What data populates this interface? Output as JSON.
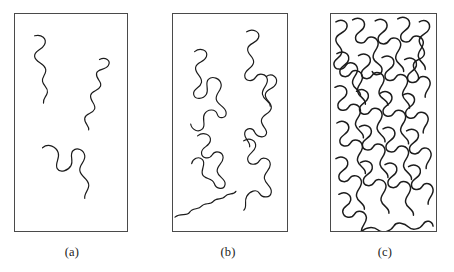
{
  "figure": {
    "type": "schematic-diagram",
    "background_color": "#ffffff",
    "panel_border_color": "#4a4a4a",
    "chain_color": "#1c1c1c"
  },
  "panels": [
    {
      "id": "a",
      "caption": "(a)",
      "regime": "dilute",
      "chain_count": 3,
      "stroke_width": 1.2,
      "box": {
        "x": 14,
        "y": 13,
        "width": 114,
        "height": 219
      },
      "chains": [
        "M 20 22 C 27 20 33 25 30 31 C 27 37 19 37 20 43 C 21 49 29 49 31 55 C 33 60 27 63 28 68 C 29 73 34 74 33 79 C 32 84 28 85 29 90",
        "M 86 46 C 92 43 98 47 95 52 C 92 57 84 55 83 60 C 82 66 89 68 87 73 C 85 78 78 77 77 82 C 76 88 83 91 81 96 C 79 101 72 100 71 105 C 70 110 76 113 75 117",
        "M 28 135 C 34 130 42 134 44 140 C 46 146 40 151 43 156 C 46 161 54 158 57 153 C 60 148 55 142 59 138 C 63 134 70 137 71 143 C 72 149 65 152 66 158 C 67 164 74 166 75 172 C 76 177 70 181 71 186"
      ]
    },
    {
      "id": "b",
      "caption": "(b)",
      "regime": "semi-dilute overlap",
      "chain_count": 6,
      "stroke_width": 1.2,
      "box": {
        "x": 172,
        "y": 13,
        "width": 116,
        "height": 219
      },
      "chains": [
        "M 22 38 C 28 33 36 37 34 43 C 32 49 24 48 23 54 C 22 60 30 63 29 69 C 28 75 20 75 21 81 C 22 87 31 86 34 81 C 37 76 32 70 36 66 C 40 62 48 65 49 71 C 50 77 43 80 44 86 C 45 92 53 93 54 99 C 55 105 47 107 45 101 C 43 95 35 96 32 101 C 29 106 34 112 30 116 C 26 120 19 117 18 111",
        "M 75 18 C 81 14 89 18 87 24 C 85 30 77 29 76 35 C 75 41 83 43 82 49 C 81 55 73 56 73 62 C 73 68 81 69 84 64 C 87 59 95 60 96 66 C 97 72 90 75 91 81 C 92 87 99 88 99 93",
        "M 95 63 C 101 59 107 64 105 70 C 103 76 95 75 94 81 C 93 87 101 89 100 95 C 99 101 91 101 90 107 C 89 113 97 116 95 121 C 93 126 85 124 83 119 C 81 114 74 115 73 120 C 72 126 79 129 78 134",
        "M 25 123 C 31 118 39 122 38 128 C 37 134 29 134 29 140 C 29 146 37 147 40 142 C 43 137 51 139 51 145 C 51 151 44 153 45 159 C 46 165 54 166 53 172 C 52 178 44 177 42 171 C 40 165 32 167 30 162 C 28 157 34 151 30 147 C 26 143 20 146 19 151",
        "M 72 128 C 78 124 85 128 84 134 C 83 140 75 141 76 147 C 77 153 85 153 88 148 C 91 143 99 146 99 152 C 99 158 92 160 93 166 C 94 172 101 174 100 180 C 99 186 91 186 88 181 C 85 176 78 179 75 184 C 72 189 76 195 72 198",
        "M 2 205 C 8 200 14 205 17 200 C 20 195 26 198 29 194 C 32 190 38 193 41 189 C 44 185 50 188 53 184 C 56 180 62 183 64 179"
      ]
    },
    {
      "id": "c",
      "caption": "(c)",
      "regime": "concentrated melt",
      "chain_count": 22,
      "stroke_width": 1.5,
      "box": {
        "x": 330,
        "y": 13,
        "width": 107,
        "height": 219
      },
      "chains": [
        "M 5 8 C 11 4 18 8 16 14 C 14 20 6 19 5 25 C 4 31 12 33 11 39 C 10 45 2 45 3 51 C 4 57 12 57 15 52 C 18 47 26 49 27 55 C 28 61 21 64 22 70 C 23 76 31 77 30 83",
        "M 22 6 C 28 2 35 6 34 12 C 33 18 25 18 25 24 C 25 30 33 31 36 26 C 39 21 47 23 48 29 C 49 35 42 38 43 44 C 44 50 52 50 52 56 C 52 62 44 63 42 58",
        "M 45 7 C 51 3 58 7 57 13 C 56 19 48 19 48 25 C 48 31 56 32 59 27 C 62 22 70 24 71 30 C 72 36 65 39 66 45 C 67 51 75 52 74 58",
        "M 68 5 C 74 1 81 5 80 11 C 79 17 71 17 71 23 C 71 29 79 30 82 25 C 85 20 93 22 94 28 C 95 34 88 37 89 43 C 90 49 97 50 96 56",
        "M 90 8 C 96 4 102 9 100 15 C 98 21 91 20 90 26 C 89 32 97 35 95 41 C 93 47 85 45 84 51 C 83 57 91 60 89 66",
        "M 6 40 C 12 36 19 40 18 46 C 17 52 9 52 9 58 C 9 64 17 65 20 60 C 23 55 31 57 32 63 C 33 69 26 72 27 78 C 28 84 36 85 35 91",
        "M 28 42 C 34 38 41 42 40 48 C 39 54 31 54 31 60 C 31 66 39 67 42 62 C 45 57 53 59 54 65 C 55 71 48 74 49 80 C 50 86 58 86 58 92",
        "M 52 44 C 58 40 65 44 64 50 C 63 56 55 56 55 62 C 55 68 63 69 66 64 C 69 59 77 61 78 67 C 79 73 72 76 73 82 C 74 88 81 89 80 95",
        "M 75 46 C 81 42 88 46 87 52 C 86 58 78 58 78 64 C 78 70 86 71 89 66 C 92 61 100 63 101 69 C 102 75 95 78 96 84",
        "M 4 74 C 10 70 17 74 16 80 C 15 86 7 86 7 92 C 7 98 15 99 18 94 C 21 89 29 91 30 97 C 31 103 24 106 25 112 C 26 118 34 119 33 125",
        "M 26 78 C 32 74 39 78 38 84 C 37 90 29 90 29 96 C 29 102 37 103 40 98 C 43 93 51 95 52 101 C 53 107 46 110 47 116 C 48 122 56 123 55 129",
        "M 50 80 C 56 76 63 80 62 86 C 61 92 53 92 53 98 C 53 104 61 105 64 100 C 67 95 75 97 76 103 C 77 109 70 112 71 118 C 72 124 80 125 79 131",
        "M 73 82 C 79 78 86 82 85 88 C 84 94 76 94 76 100 C 76 106 84 107 87 102 C 90 97 98 99 99 105 C 100 111 93 114 94 120",
        "M 6 110 C 12 106 19 110 18 116 C 17 122 9 122 9 128 C 9 134 17 135 20 130 C 23 125 31 127 32 133 C 33 139 26 142 27 148 C 28 154 36 155 35 161",
        "M 29 114 C 35 110 42 114 41 120 C 40 126 32 126 32 132 C 32 138 40 139 43 134 C 46 129 54 131 55 137 C 56 143 49 146 50 152 C 51 158 59 159 58 165",
        "M 53 116 C 59 112 66 116 65 122 C 64 128 56 128 56 134 C 56 140 64 141 67 136 C 70 131 78 133 79 139 C 80 145 73 148 74 154 C 75 160 83 161 82 167",
        "M 77 118 C 83 114 90 118 89 124 C 88 130 80 130 80 136 C 80 142 88 143 91 138 C 94 133 101 135 102 141 C 103 147 96 150 97 156",
        "M 5 146 C 11 142 18 146 17 152 C 16 158 8 158 8 164 C 8 170 16 171 19 166 C 22 161 30 163 31 169 C 32 175 25 178 26 184 C 27 190 35 191 34 197",
        "M 30 150 C 36 146 43 150 42 156 C 41 162 33 162 33 168 C 33 174 41 175 44 170 C 47 165 55 167 56 173 C 57 179 50 182 51 188 C 52 194 60 195 59 201",
        "M 55 152 C 61 148 68 152 67 158 C 66 164 58 164 58 170 C 58 176 66 177 69 172 C 72 167 80 169 81 175 C 82 181 75 184 76 190 C 77 196 85 197 84 203",
        "M 79 154 C 85 150 92 154 91 160 C 90 166 82 166 82 172 C 82 178 90 179 93 174 C 96 169 103 171 104 177 C 105 183 98 186 99 192",
        "M 8 182 C 14 178 21 182 20 188 C 19 194 11 194 12 200 C 13 206 21 207 24 202 C 27 197 35 199 36 205 C 37 211 30 214 31 220 C 35 215 43 214 48 218 C 53 222 61 219 64 214 C 67 209 75 211 79 215 C 83 219 91 217 94 212 C 97 207 103 209 104 214"
      ]
    }
  ]
}
